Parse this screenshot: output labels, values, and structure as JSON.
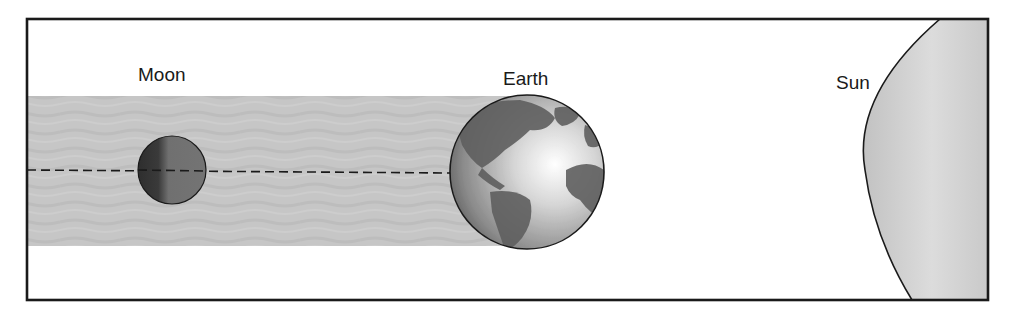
{
  "diagram": {
    "type": "lunar-eclipse",
    "labels": {
      "moon": "Moon",
      "earth": "Earth",
      "sun": "Sun"
    },
    "colors": {
      "frame": "#1a1a1a",
      "shadow_band": "#c4c4c4",
      "sun_fill": "#cfcfcf",
      "moon_fill": "#6a6a6a",
      "earth_ocean": "#bdbdbd",
      "earth_land": "#5e5e5e",
      "axis_line": "#1a1a1a"
    }
  }
}
